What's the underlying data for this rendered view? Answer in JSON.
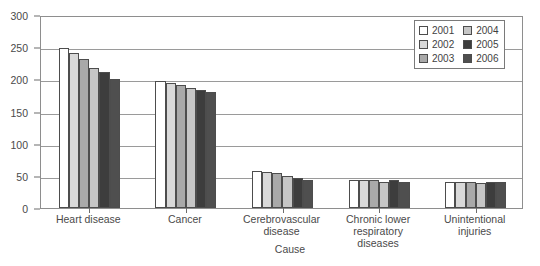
{
  "chart_data": {
    "type": "bar",
    "title": "",
    "xlabel": "Cause",
    "ylabel": "",
    "ylim": [
      0,
      300
    ],
    "ytick_values": [
      0,
      50,
      100,
      150,
      200,
      250,
      300
    ],
    "ytick_labels": [
      "0",
      "50",
      "100",
      "150",
      "200",
      "250",
      "300"
    ],
    "grid": true,
    "legend_position": "upper-right",
    "categories": [
      "Heart disease",
      "Cancer",
      "Cerebrovascular disease",
      "Chronic lower respiratory diseases",
      "Unintentional injuries"
    ],
    "series": [
      {
        "name": "2001",
        "color": "#ffffff",
        "values": [
          248,
          198,
          58,
          43,
          40
        ]
      },
      {
        "name": "2002",
        "color": "#d9d9d9",
        "values": [
          241,
          194,
          56,
          43,
          40
        ]
      },
      {
        "name": "2003",
        "color": "#a9a9a9",
        "values": [
          232,
          191,
          54,
          43,
          41
        ]
      },
      {
        "name": "2004",
        "color": "#c6c6c6",
        "values": [
          218,
          186,
          50,
          41,
          39
        ]
      },
      {
        "name": "2005",
        "color": "#3d3d3d",
        "values": [
          211,
          184,
          47,
          43,
          40
        ]
      },
      {
        "name": "2006",
        "color": "#4f4f4f",
        "values": [
          201,
          181,
          44,
          41,
          40
        ]
      }
    ]
  },
  "legend": {
    "columns": [
      {
        "items": [
          {
            "label": "2001",
            "color": "#ffffff"
          },
          {
            "label": "2002",
            "color": "#d9d9d9"
          },
          {
            "label": "2003",
            "color": "#a9a9a9"
          }
        ]
      },
      {
        "items": [
          {
            "label": "2004",
            "color": "#c6c6c6"
          },
          {
            "label": "2005",
            "color": "#3d3d3d"
          },
          {
            "label": "2006",
            "color": "#4f4f4f"
          }
        ]
      }
    ]
  },
  "style": {
    "axis_color": "#8e8e8e",
    "grid_color": "#9a9a9a",
    "bar_border": "#4d4d4d",
    "text_color": "#4a4a4a"
  }
}
